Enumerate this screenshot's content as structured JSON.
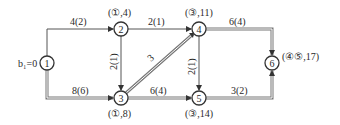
{
  "diagram": {
    "type": "directed-network-shortest-path",
    "start_label": "b₁=0",
    "nodes": [
      {
        "id": "1",
        "x": 47,
        "y": 63,
        "mark": ""
      },
      {
        "id": "2",
        "x": 121,
        "y": 29,
        "mark": "(①,4)"
      },
      {
        "id": "3",
        "x": 121,
        "y": 98,
        "mark": "(①,8)"
      },
      {
        "id": "4",
        "x": 199,
        "y": 29,
        "mark": "(③,11)"
      },
      {
        "id": "5",
        "x": 199,
        "y": 98,
        "mark": "(③,14)"
      },
      {
        "id": "6",
        "x": 272,
        "y": 63,
        "mark": "(④⑤,17)"
      }
    ],
    "edges": [
      {
        "from": "1",
        "to": "2",
        "label": "4(2)",
        "highlighted": false
      },
      {
        "from": "1",
        "to": "3",
        "label": "8(6)",
        "highlighted": true
      },
      {
        "from": "2",
        "to": "4",
        "label": "2(1)",
        "highlighted": false
      },
      {
        "from": "2",
        "to": "3",
        "label": "2(1)",
        "highlighted": false
      },
      {
        "from": "3",
        "to": "4",
        "label": "3",
        "highlighted": true
      },
      {
        "from": "3",
        "to": "5",
        "label": "6(4)",
        "highlighted": true
      },
      {
        "from": "4",
        "to": "5",
        "label": "2(1)",
        "highlighted": false
      },
      {
        "from": "4",
        "to": "6",
        "label": "6(4)",
        "highlighted": true
      },
      {
        "from": "5",
        "to": "6",
        "label": "3(2)",
        "highlighted": true
      }
    ]
  }
}
